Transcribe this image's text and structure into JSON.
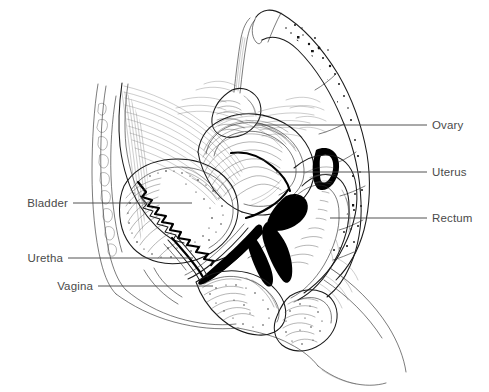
{
  "figure": {
    "background_color": "#ffffff",
    "ink_color": "#1a1a1a",
    "label_color": "#4a4a4a",
    "leader_color": "#3f3f3f",
    "width": 489,
    "height": 392
  },
  "labels": {
    "right": [
      {
        "id": "ovary",
        "text": "Ovary",
        "text_x": 432,
        "text_y": 129,
        "line_x1": 255,
        "line_x2": 427,
        "line_y": 125
      },
      {
        "id": "uterus",
        "text": "Uterus",
        "text_x": 432,
        "text_y": 176,
        "line_x1": 276,
        "line_x2": 427,
        "line_y": 172
      },
      {
        "id": "rectum",
        "text": "Rectum",
        "text_x": 432,
        "text_y": 222,
        "line_x1": 330,
        "line_x2": 427,
        "line_y": 218
      }
    ],
    "left": [
      {
        "id": "bladder",
        "text": "Bladder",
        "text_x": 68,
        "text_y": 207,
        "line_x1": 73,
        "line_x2": 192,
        "line_y": 203
      },
      {
        "id": "uretha",
        "text": "Uretha",
        "text_x": 63,
        "text_y": 262,
        "line_x1": 68,
        "line_x2": 193,
        "line_y": 258
      },
      {
        "id": "vagina",
        "text": "Vagina",
        "text_x": 93,
        "text_y": 290,
        "line_x1": 98,
        "line_x2": 213,
        "line_y": 286
      }
    ]
  },
  "structures": [
    {
      "id": "sacrum",
      "name": "Sacrum and coccyx with trabecular bone"
    },
    {
      "id": "vertebral-body",
      "name": "Lumbar vertebral body"
    },
    {
      "id": "abdominal-wall",
      "name": "Anterior abdominal wall"
    },
    {
      "id": "rectus-muscle",
      "name": "Rectus abdominis muscle"
    },
    {
      "id": "subcutaneous-fat",
      "name": "Subcutaneous fat layer"
    },
    {
      "id": "bladder-body",
      "name": "Urinary bladder with rugae"
    },
    {
      "id": "uterus-body",
      "name": "Uterus (anteverted)"
    },
    {
      "id": "endometrial-cavity",
      "name": "Endometrial cavity"
    },
    {
      "id": "cervix",
      "name": "Cervix"
    },
    {
      "id": "vaginal-canal",
      "name": "Vaginal canal"
    },
    {
      "id": "urethra-canal",
      "name": "Urethra"
    },
    {
      "id": "rectum-body",
      "name": "Rectum"
    },
    {
      "id": "anal-canal",
      "name": "Anal canal"
    },
    {
      "id": "ovary-body",
      "name": "Ovary"
    },
    {
      "id": "fallopian-tube",
      "name": "Fallopian tube / suspensory ligament"
    },
    {
      "id": "perineal-body",
      "name": "Perineal body"
    },
    {
      "id": "buttock-contour",
      "name": "Gluteal skin contour"
    },
    {
      "id": "labia-contour",
      "name": "External genital contour"
    }
  ]
}
